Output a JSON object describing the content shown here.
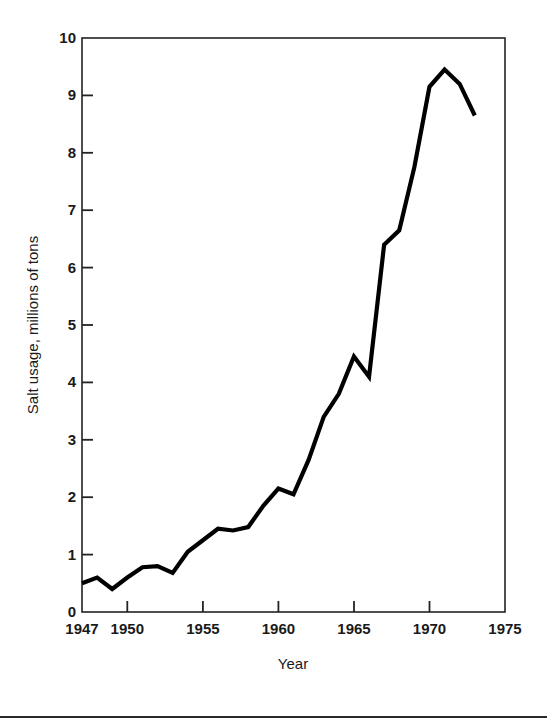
{
  "chart_data": {
    "type": "line",
    "title": "",
    "xlabel": "Year",
    "ylabel": "Salt usage, millions of tons",
    "xlim": [
      1947,
      1975
    ],
    "ylim": [
      0,
      10
    ],
    "grid": false,
    "legend": null,
    "xticks": [
      1947,
      1950,
      1955,
      1960,
      1965,
      1970,
      1975
    ],
    "xtick_labels": [
      "1947",
      "1950",
      "1955",
      "1960",
      "1965",
      "1970",
      "1975"
    ],
    "yticks": [
      0,
      1,
      2,
      3,
      4,
      5,
      6,
      7,
      8,
      9,
      10
    ],
    "ytick_labels": [
      "0",
      "1",
      "2",
      "3",
      "4",
      "5",
      "6",
      "7",
      "8",
      "9",
      "10"
    ],
    "series": [
      {
        "name": "Salt usage",
        "color": "#000000",
        "x": [
          1947,
          1948,
          1949,
          1950,
          1951,
          1952,
          1953,
          1954,
          1955,
          1956,
          1957,
          1958,
          1959,
          1960,
          1961,
          1962,
          1963,
          1964,
          1965,
          1966,
          1967,
          1968,
          1969,
          1970,
          1971,
          1972,
          1973
        ],
        "values": [
          0.5,
          0.6,
          0.4,
          0.6,
          0.78,
          0.8,
          0.68,
          1.05,
          1.25,
          1.45,
          1.42,
          1.48,
          1.85,
          2.15,
          2.05,
          2.65,
          3.4,
          3.8,
          4.45,
          4.1,
          6.4,
          6.65,
          7.75,
          9.15,
          9.45,
          9.2,
          8.65
        ]
      }
    ]
  },
  "axes": {
    "x_axis_title": "Year",
    "y_axis_title": "Salt usage, millions of tons"
  }
}
